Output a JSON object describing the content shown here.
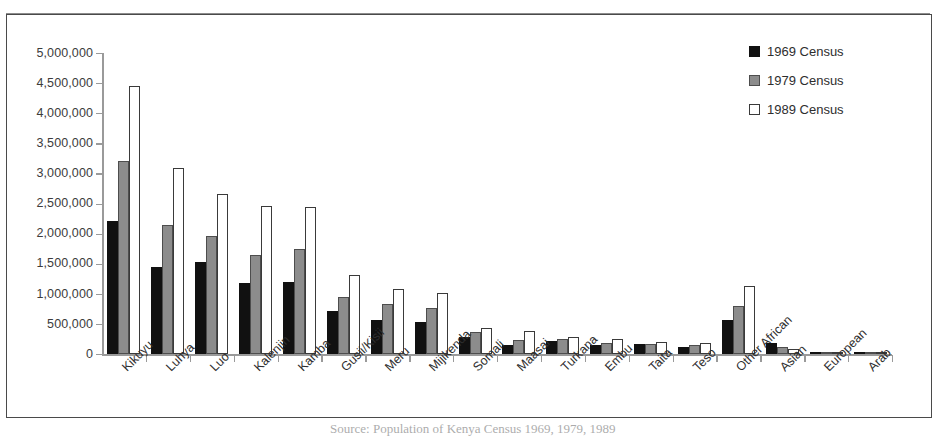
{
  "chart_data": {
    "type": "bar",
    "title": "",
    "xlabel": "",
    "ylabel": "",
    "ylim": [
      0,
      5000000
    ],
    "ytick_step": 500000,
    "grid": false,
    "legend_position": "top-right",
    "categories": [
      "Kikuyu",
      "Luhya",
      "Luo",
      "Kalenjin",
      "Kamba",
      "Gusii/Kisii",
      "Meru",
      "Mijikenda",
      "Somali",
      "Maasai",
      "Turkana",
      "Embu",
      "Taita",
      "Teso",
      "Other African",
      "Asian",
      "European",
      "Arab"
    ],
    "ytick_labels": [
      "5,000,000",
      "4,500,000",
      "4,000,000",
      "3,500,000",
      "3,000,000",
      "2,500,000",
      "2,000,000",
      "1,500,000",
      "1,000,000",
      "500,000",
      "0"
    ],
    "ytick_values": [
      5000000,
      4500000,
      4000000,
      3500000,
      3000000,
      2500000,
      2000000,
      1500000,
      1000000,
      500000,
      0
    ],
    "series": [
      {
        "name": "1969 Census",
        "color": "#111111",
        "values": [
          2201632,
          1453302,
          1521595,
          1187000,
          1197712,
          710000,
          560000,
          532000,
          276000,
          155000,
          220000,
          150000,
          160000,
          120000,
          560000,
          180000,
          41000,
          28000
        ]
      },
      {
        "name": "1979 Census",
        "color": "#8c8c8c",
        "values": [
          3202000,
          2143000,
          1956000,
          1652000,
          1752000,
          941000,
          830000,
          765000,
          374000,
          241000,
          246000,
          180000,
          165000,
          145000,
          790000,
          120000,
          40000,
          39000
        ]
      },
      {
        "name": "1989 Census",
        "color": "#ffffff",
        "values": [
          4455000,
          3083000,
          2653000,
          2458000,
          2448000,
          1318000,
          1087000,
          1007000,
          440000,
          377000,
          284000,
          256000,
          203000,
          178000,
          1128000,
          89000,
          34000,
          41000
        ]
      }
    ]
  },
  "legend": {
    "items": [
      {
        "label": "1969 Census",
        "swatch": "black-filled-square"
      },
      {
        "label": "1979 Census",
        "swatch": "gray-filled-square"
      },
      {
        "label": "1989 Census",
        "swatch": "white-outlined-square"
      }
    ]
  },
  "caption": {
    "partial_text": "Source: Population of Kenya Census 1969, 1979, 1989"
  }
}
